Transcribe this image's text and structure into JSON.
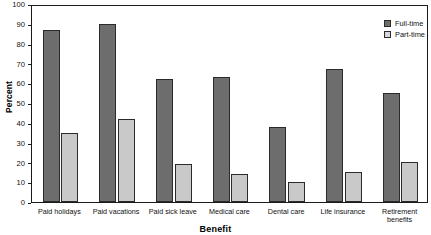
{
  "chart_data": {
    "type": "bar",
    "title": "",
    "xlabel": "Benefit",
    "ylabel": "Percent",
    "ylim": [
      0,
      100
    ],
    "yticks": [
      0,
      10,
      20,
      30,
      40,
      50,
      60,
      70,
      80,
      90,
      100
    ],
    "grid": false,
    "legend_position": "top-right",
    "categories": [
      "Paid holidays",
      "Paid vacations",
      "Paid sick leave",
      "Medical care",
      "Dental care",
      "Life insurance",
      "Retirement\nbenefits"
    ],
    "series": [
      {
        "name": "Full-time",
        "color": "#6d6d6d",
        "values": [
          87,
          90,
          62,
          63,
          38,
          67,
          55
        ]
      },
      {
        "name": "Part-time",
        "color": "#c9c9c9",
        "values": [
          35,
          42,
          19,
          14,
          10,
          15,
          20
        ]
      }
    ]
  },
  "legend": {
    "items": [
      {
        "label": "Full-time"
      },
      {
        "label": "Part-time"
      }
    ]
  },
  "axes": {
    "y_title": "Percent",
    "x_title": "Benefit",
    "y_tick_labels": [
      "0",
      "10",
      "20",
      "30",
      "40",
      "50",
      "60",
      "70",
      "80",
      "90",
      "100"
    ]
  }
}
